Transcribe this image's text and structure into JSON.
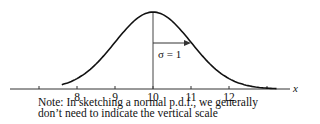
{
  "figure": {
    "type": "normal-pdf-sketch",
    "mean": 10,
    "sigma": 1,
    "sigma_label": "σ = 1",
    "x_axis_label": "x",
    "ticks": [
      {
        "value": 7,
        "label": ""
      },
      {
        "value": 8,
        "label": "8"
      },
      {
        "value": 9,
        "label": "9"
      },
      {
        "value": 10,
        "label": "10"
      },
      {
        "value": 11,
        "label": "11"
      },
      {
        "value": 12,
        "label": "12"
      },
      {
        "value": 13,
        "label": ""
      }
    ],
    "note_lines": [
      "Note: In sketching a normal p.d.f., we generally",
      "don’t need to indicate the vertical scale"
    ],
    "colors": {
      "curve": "#111111",
      "axis": "#333333",
      "text": "#111111"
    }
  }
}
